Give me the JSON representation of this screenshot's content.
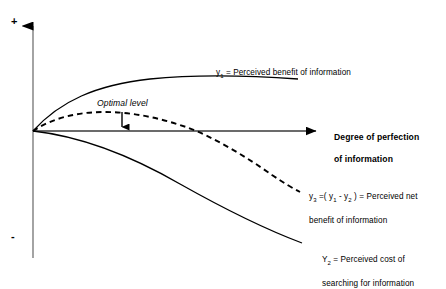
{
  "diagram": {
    "background_color": "#ffffff",
    "line_color": "#000000",
    "axes": {
      "vertical_positive_marker": "+",
      "vertical_negative_marker": "-",
      "x_axis_label_line1": "Degree of perfection",
      "x_axis_label_line2": "of information",
      "origin": {
        "x": 33,
        "y": 131
      },
      "vertical_axis_top": {
        "x": 33,
        "y": 14
      },
      "vertical_axis_bottom": {
        "x": 33,
        "y": 258
      },
      "horizontal_axis_end": {
        "x": 327,
        "y": 131
      }
    },
    "annotations": {
      "optimal_level": "Optimal level",
      "optimal_level_arrow": {
        "x": 122,
        "y_top": 113,
        "y_bottom": 131
      }
    },
    "curves": [
      {
        "name": "perceived-benefit",
        "style": "solid",
        "label_prefix": "y",
        "label_subscript": "1",
        "label_text": " = Perceived benefit of information",
        "label_full": "y1 = Perceived benefit of information",
        "description": "Concave increasing curve from origin flattening toward the right"
      },
      {
        "name": "perceived-net-benefit",
        "style": "dashed",
        "label_prefix": "y",
        "label_subscript": "3",
        "label_text": " =( y1 - y2 ) = Perceived net benefit of information",
        "label_line1_a": "y",
        "label_line1_sub": "3",
        "label_line1_b": " =( y",
        "label_line1_sub2": "1",
        "label_line1_c": " - y",
        "label_line1_sub3": "2",
        "label_line1_d": " ) = Perceived net",
        "label_line2": "benefit of information",
        "description": "Inverted-U dashed curve peaking near the optimal level then falling below the axis"
      },
      {
        "name": "perceived-cost",
        "style": "solid",
        "label_prefix": "Y",
        "label_subscript": "2",
        "label_line1": " = Perceived cost of",
        "label_line2": "searching for information",
        "label_full": "Y2 = Perceived cost of searching for information",
        "description": "Convex decreasing curve from origin descending steeply to the lower right"
      }
    ]
  }
}
